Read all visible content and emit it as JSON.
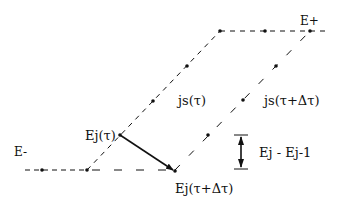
{
  "diagram": {
    "colors": {
      "line": "#111111",
      "background": "#ffffff"
    },
    "labels": {
      "e_plus": "E+",
      "e_minus": "E-",
      "js_tau": "js(τ)",
      "js_tau_dt": "js(τ+Δτ)",
      "ej_tau": "Ej(τ)",
      "ej_tau_dt": "Ej(τ+Δτ)",
      "energy_gap": "Ej - Ej-1"
    },
    "curves": [
      {
        "name": "js(τ)",
        "style": "dashed",
        "points": [
          [
            25,
            170
          ],
          [
            87,
            170
          ],
          [
            220,
            31
          ],
          [
            325,
            31
          ]
        ],
        "dots": [
          [
            42,
            170
          ],
          [
            87,
            170
          ],
          [
            120,
            135
          ],
          [
            153,
            101
          ],
          [
            187,
            66
          ],
          [
            220,
            31
          ],
          [
            265,
            31
          ],
          [
            310,
            31
          ]
        ]
      },
      {
        "name": "js(τ+Δτ)",
        "style": "dashed",
        "points": [
          [
            87,
            170
          ],
          [
            175,
            170
          ],
          [
            310,
            31
          ]
        ],
        "dots": [
          [
            175,
            171
          ],
          [
            208,
            135
          ],
          [
            243,
            100
          ],
          [
            276,
            66
          ]
        ]
      }
    ],
    "arrows": [
      {
        "name": "Ej(τ) to Ej(τ+Δτ)",
        "from": [
          120,
          135
        ],
        "to": [
          175,
          171
        ]
      },
      {
        "name": "Ej - Ej-1",
        "from": [
          241,
          135
        ],
        "to": [
          241,
          169
        ],
        "double": true
      }
    ]
  }
}
